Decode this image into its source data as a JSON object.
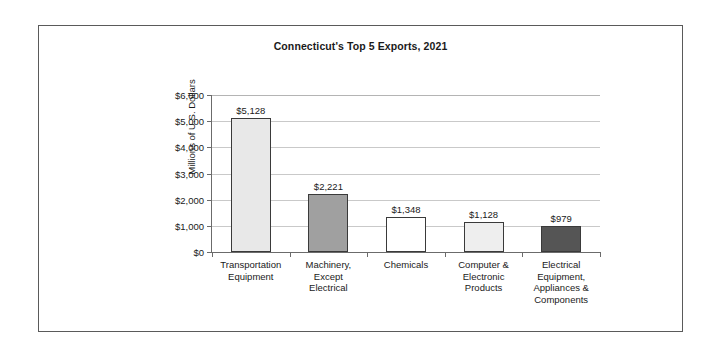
{
  "figure": {
    "background": "#ffffff",
    "frame_color": "#5a5a5a"
  },
  "chart_data": {
    "type": "bar",
    "title": "Connecticut's Top 5 Exports, 2021",
    "xlabel": "",
    "ylabel": "Millions of U.S. Dollars",
    "ylim": [
      0,
      6000
    ],
    "ytick_labels": [
      "$6,000",
      "$5,000",
      "$4,000",
      "$3,000",
      "$2,000",
      "$1,000",
      "$0"
    ],
    "ytick_values": [
      6000,
      5000,
      4000,
      3000,
      2000,
      1000,
      0
    ],
    "grid": true,
    "legend": null,
    "categories": [
      "Transportation Equipment",
      "Machinery, Except Electrical",
      "Chemicals",
      "Computer & Electronic Products",
      "Electrical Equipment, Appliances & Components"
    ],
    "category_label_lines": [
      [
        "Transportation",
        "Equipment"
      ],
      [
        "Machinery,",
        "Except",
        "Electrical"
      ],
      [
        "Chemicals"
      ],
      [
        "Computer &",
        "Electronic",
        "Products"
      ],
      [
        "Electrical",
        "Equipment,",
        "Appliances &",
        "Components"
      ]
    ],
    "values": [
      5128,
      2221,
      1348,
      1128,
      979
    ],
    "value_labels": [
      "$5,128",
      "$2,221",
      "$1,348",
      "$1,128",
      "$979"
    ],
    "bar_colors": [
      "#e8e8e8",
      "#a0a0a0",
      "#ffffff",
      "#eeeeee",
      "#555555"
    ],
    "bar_edge_color": "#3a3a3a"
  }
}
